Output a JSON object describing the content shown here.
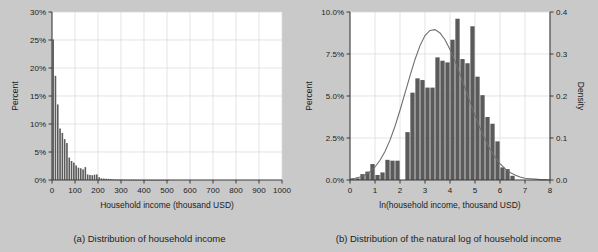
{
  "figure": {
    "background_color": "#c9c9c9",
    "bar_color": "#5a5a5a",
    "curve_color": "#6e6e6e",
    "grid_color": "#d9d9d9"
  },
  "panel_a": {
    "caption": "(a) Distribution of household income",
    "chart_data": {
      "type": "bar",
      "title": "",
      "xlabel": "Household income (thousand USD)",
      "ylabel": "Percent",
      "xlim": [
        0,
        1000
      ],
      "ylim": [
        0,
        30
      ],
      "grid": true,
      "legend": "none",
      "xticks": [
        0,
        100,
        200,
        300,
        400,
        500,
        600,
        700,
        800,
        900,
        1000
      ],
      "xticklabels": [
        "0",
        "100",
        "200",
        "300",
        "400",
        "500",
        "600",
        "700",
        "800",
        "900",
        "1000"
      ],
      "yticks": [
        0,
        5,
        10,
        15,
        20,
        25,
        30
      ],
      "yticklabels": [
        "0%",
        "5%",
        "10%",
        "15%",
        "20%",
        "25%",
        "30%"
      ],
      "bin_width": 10,
      "bin_starts": [
        0,
        10,
        20,
        30,
        40,
        50,
        60,
        70,
        80,
        90,
        100,
        110,
        120,
        130,
        140,
        150,
        160,
        170,
        180,
        190,
        200,
        210,
        220,
        230,
        240,
        250,
        260,
        270,
        280,
        290,
        300,
        310,
        320,
        330,
        340,
        350,
        360,
        370,
        380,
        390,
        400,
        410,
        420,
        430,
        440,
        450,
        460,
        470,
        480,
        490,
        500
      ],
      "values": [
        25.1,
        18.6,
        13.5,
        9.2,
        8.4,
        7.3,
        6.6,
        4.0,
        3.4,
        3.1,
        2.6,
        2.2,
        2.1,
        1.9,
        2.3,
        1.0,
        0.9,
        0.85,
        0.95,
        1.0,
        0.5,
        0.3,
        0.25,
        0.22,
        0.2,
        0.18,
        0.1,
        0.09,
        0.08,
        0.07,
        0.06,
        0.05,
        0.05,
        0.04,
        0.04,
        0.03,
        0.03,
        0.03,
        0.02,
        0.02,
        0.02,
        0.02,
        0.02,
        0.01,
        0.01,
        0.01,
        0.01,
        0.01,
        0.01,
        0.01,
        0.01
      ]
    }
  },
  "panel_b": {
    "caption": "(b) Distribution of the natural log of household income",
    "chart_data": {
      "type": "bar",
      "title": "",
      "xlabel": "ln(household income, thousand USD)",
      "ylabel": "Percent",
      "y2label": "Density",
      "xlim": [
        0,
        8
      ],
      "ylim": [
        0,
        10
      ],
      "y2lim": [
        0,
        0.4
      ],
      "grid": true,
      "legend": "none",
      "xticks": [
        0,
        1,
        2,
        3,
        4,
        5,
        6,
        7,
        8
      ],
      "xticklabels": [
        "0",
        "1",
        "2",
        "3",
        "4",
        "5",
        "6",
        "7",
        "8"
      ],
      "yticks": [
        0,
        2.5,
        5,
        7.5,
        10
      ],
      "yticklabels": [
        "0.0%",
        "2.5%",
        "5.0%",
        "7.5%",
        "10.0%"
      ],
      "y2ticks": [
        0,
        0.1,
        0.2,
        0.3,
        0.4
      ],
      "y2ticklabels": [
        "0.0",
        "0.1",
        "0.2",
        "0.3",
        "0.4"
      ],
      "bin_width": 0.2,
      "bin_starts": [
        0.0,
        0.2,
        0.4,
        0.6,
        0.8,
        1.0,
        1.2,
        1.4,
        1.6,
        1.8,
        2.0,
        2.2,
        2.4,
        2.6,
        2.8,
        3.0,
        3.2,
        3.4,
        3.6,
        3.8,
        4.0,
        4.2,
        4.4,
        4.6,
        4.8,
        5.0,
        5.2,
        5.4,
        5.6,
        5.8,
        6.0,
        6.2,
        6.4,
        6.6,
        6.8,
        7.0,
        7.2,
        7.4,
        7.6,
        7.8
      ],
      "values": [
        0.05,
        0.1,
        0.35,
        0.5,
        0.95,
        0.3,
        0.45,
        1.2,
        1.15,
        1.15,
        0.0,
        2.85,
        5.2,
        6.05,
        5.95,
        5.5,
        5.5,
        7.3,
        7.1,
        7.0,
        8.35,
        9.6,
        7.2,
        6.95,
        9.15,
        6.15,
        5.05,
        3.75,
        3.35,
        2.3,
        0.75,
        0.65,
        0.25,
        0.0,
        0.0,
        0.0,
        0.0,
        0.0,
        0.0,
        0.0
      ],
      "density_curve": {
        "name": "Normal density fit",
        "mean": 3.85,
        "sd": 1.1,
        "peak_density": 0.358,
        "x": [
          0.0,
          0.2,
          0.4,
          0.6,
          0.8,
          1.0,
          1.2,
          1.4,
          1.6,
          1.8,
          2.0,
          2.2,
          2.4,
          2.6,
          2.8,
          3.0,
          3.2,
          3.4,
          3.6,
          3.8,
          4.0,
          4.2,
          4.4,
          4.6,
          4.8,
          5.0,
          5.2,
          5.4,
          5.6,
          5.8,
          6.0,
          6.2,
          6.4,
          6.6,
          6.8,
          7.0,
          7.2,
          7.4,
          7.6,
          7.8,
          8.0
        ],
        "y": [
          0.002,
          0.004,
          0.007,
          0.012,
          0.02,
          0.031,
          0.047,
          0.068,
          0.095,
          0.128,
          0.166,
          0.207,
          0.248,
          0.287,
          0.32,
          0.344,
          0.356,
          0.358,
          0.35,
          0.334,
          0.311,
          0.283,
          0.252,
          0.219,
          0.186,
          0.154,
          0.124,
          0.097,
          0.074,
          0.055,
          0.039,
          0.027,
          0.018,
          0.012,
          0.007,
          0.004,
          0.003,
          0.002,
          0.001,
          0.001,
          0.0
        ]
      }
    }
  }
}
